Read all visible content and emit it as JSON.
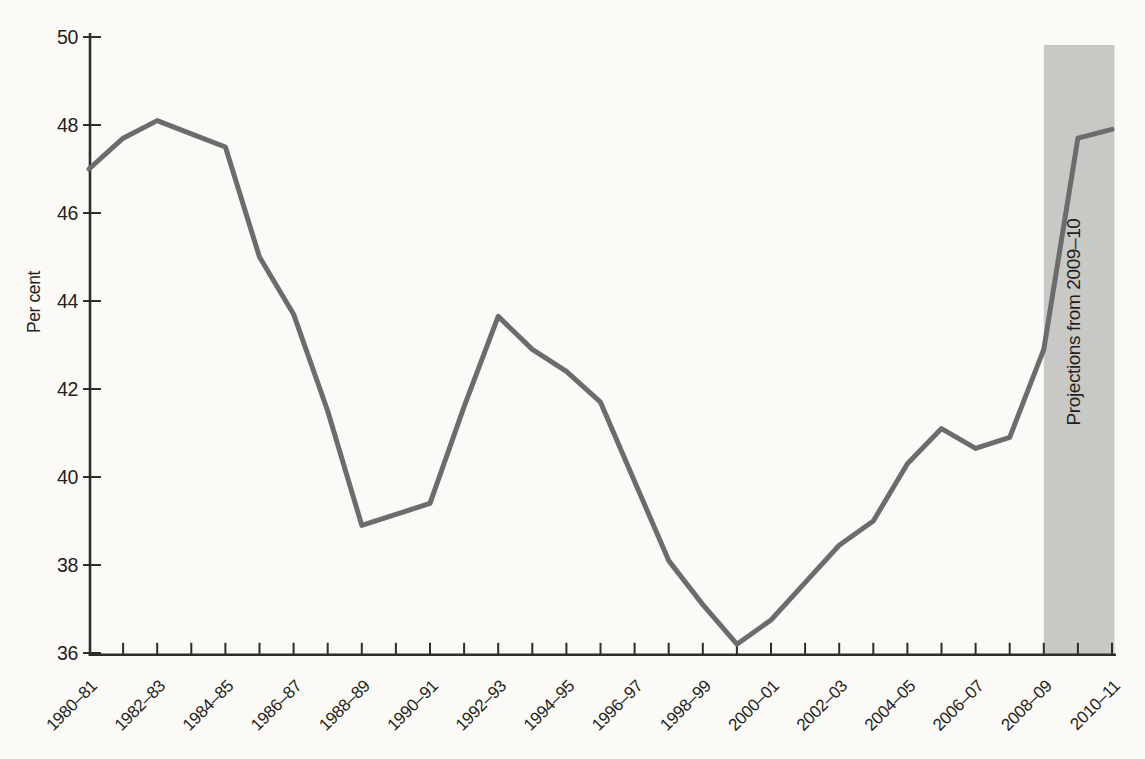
{
  "page": {
    "background": "#fbfaf7"
  },
  "chart_data": {
    "type": "line",
    "title": "",
    "xlabel": "",
    "ylabel": "Per cent",
    "ylim": [
      36,
      50
    ],
    "yticks": [
      36,
      38,
      40,
      42,
      44,
      46,
      48,
      50
    ],
    "grid": false,
    "legend": false,
    "x_label_every": 2,
    "categories": [
      "1980–81",
      "1981–82",
      "1982–83",
      "1983–84",
      "1984–85",
      "1985–86",
      "1986–87",
      "1987–88",
      "1988–89",
      "1989–90",
      "1990–91",
      "1991–92",
      "1992–93",
      "1993–94",
      "1994–95",
      "1995–96",
      "1996–97",
      "1997–98",
      "1998–99",
      "1999–00",
      "2000–01",
      "2001–02",
      "2002–03",
      "2003–04",
      "2004–05",
      "2005–06",
      "2006–07",
      "2007–08",
      "2008–09",
      "2009–10",
      "2010–11"
    ],
    "series": [
      {
        "name": "Per cent",
        "values": [
          47.0,
          47.7,
          48.1,
          47.8,
          47.5,
          45.0,
          43.7,
          41.5,
          38.9,
          39.15,
          39.4,
          41.6,
          43.65,
          42.9,
          42.4,
          41.7,
          39.9,
          38.1,
          37.1,
          36.2,
          36.75,
          37.6,
          38.45,
          39.0,
          40.3,
          41.1,
          40.65,
          40.9,
          42.9,
          47.7,
          47.9
        ]
      }
    ],
    "projection": {
      "label": "Projections from 2009–10",
      "start_category": "2008–09",
      "start_index": 28,
      "band_color": "#c8c8c4"
    },
    "colors": {
      "line": "#6b6c6e",
      "axis": "#2e2d2b",
      "text": "#231f20",
      "background": "#fbfaf7"
    }
  }
}
